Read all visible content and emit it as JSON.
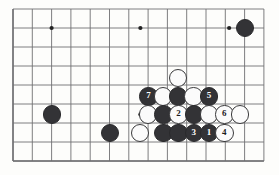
{
  "diagram": {
    "kind": "go-board-diagram",
    "game": "Go",
    "board_region": "partial board, right-side lower area",
    "geometry": {
      "origin_x": 13,
      "origin_y": 9,
      "step_x": 19.3,
      "step_y": 19.0,
      "cols": 14,
      "rows": 9,
      "stone_radius": 9.2
    },
    "colors": {
      "background": "#fdfdfb",
      "line": "#6f6f72",
      "black_stone": "#333336",
      "white_stone": "#fbfbfb",
      "stone_outline": "#3a3a3c",
      "black_label_text": "#ffffff",
      "white_label_text": "#1b1b1d"
    },
    "star_points": [
      {
        "col": 2,
        "row": 1
      },
      {
        "col": 6.6,
        "row": 1
      },
      {
        "col": 11.2,
        "row": 1
      },
      {
        "col": 6.6,
        "row": 5.55
      }
    ],
    "stones": [
      {
        "color": "black",
        "label": "",
        "col": 12.03,
        "row": 1.0,
        "name": "black-stone-upper-right"
      },
      {
        "color": "black",
        "label": "",
        "col": 2.02,
        "row": 5.55,
        "name": "black-stone-left"
      },
      {
        "color": "black",
        "label": "",
        "col": 5.03,
        "row": 6.52,
        "name": "black-stone-lower-left"
      },
      {
        "color": "white",
        "label": "",
        "col": 6.58,
        "row": 6.52,
        "name": "white-stone-lower-left"
      },
      {
        "color": "white",
        "label": "",
        "col": 8.56,
        "row": 3.62,
        "name": "white-stone-top-of-cluster"
      },
      {
        "color": "black",
        "label": "7",
        "col": 7.02,
        "row": 4.6,
        "name": "black-stone-7"
      },
      {
        "color": "white",
        "label": "",
        "col": 7.77,
        "row": 4.6,
        "name": "white-stone-row4-b"
      },
      {
        "color": "black",
        "label": "",
        "col": 8.56,
        "row": 4.6,
        "name": "black-stone-row4-c"
      },
      {
        "color": "white",
        "label": "",
        "col": 9.35,
        "row": 4.6,
        "name": "white-stone-row4-d"
      },
      {
        "color": "black",
        "label": "5",
        "col": 10.15,
        "row": 4.6,
        "name": "black-stone-5"
      },
      {
        "color": "white",
        "label": "",
        "col": 7.0,
        "row": 5.55,
        "name": "white-stone-row5-a"
      },
      {
        "color": "black",
        "label": "",
        "col": 7.8,
        "row": 5.55,
        "name": "black-stone-row5-b"
      },
      {
        "color": "white",
        "label": "2",
        "col": 8.58,
        "row": 5.55,
        "name": "white-stone-2"
      },
      {
        "color": "black",
        "label": "",
        "col": 9.37,
        "row": 5.55,
        "name": "black-stone-row5-d"
      },
      {
        "color": "white",
        "label": "",
        "col": 10.16,
        "row": 5.55,
        "name": "white-stone-row5-e"
      },
      {
        "color": "white",
        "label": "6",
        "col": 10.95,
        "row": 5.55,
        "name": "white-stone-6"
      },
      {
        "color": "white",
        "label": "",
        "col": 11.75,
        "row": 5.55,
        "name": "white-stone-row5-g"
      },
      {
        "color": "black",
        "label": "",
        "col": 7.8,
        "row": 6.52,
        "name": "black-stone-row6-a"
      },
      {
        "color": "black",
        "label": "",
        "col": 8.58,
        "row": 6.52,
        "name": "black-stone-row6-b"
      },
      {
        "color": "black",
        "label": "3",
        "col": 9.37,
        "row": 6.52,
        "name": "black-stone-3"
      },
      {
        "color": "black",
        "label": "1",
        "col": 10.16,
        "row": 6.52,
        "name": "black-stone-1"
      },
      {
        "color": "white",
        "label": "4",
        "col": 10.95,
        "row": 6.52,
        "name": "white-stone-4"
      }
    ],
    "move_sequence": [
      {
        "number": "1",
        "color": "black"
      },
      {
        "number": "2",
        "color": "white"
      },
      {
        "number": "3",
        "color": "black"
      },
      {
        "number": "4",
        "color": "white"
      },
      {
        "number": "5",
        "color": "black"
      },
      {
        "number": "6",
        "color": "white"
      },
      {
        "number": "7",
        "color": "black"
      }
    ]
  }
}
